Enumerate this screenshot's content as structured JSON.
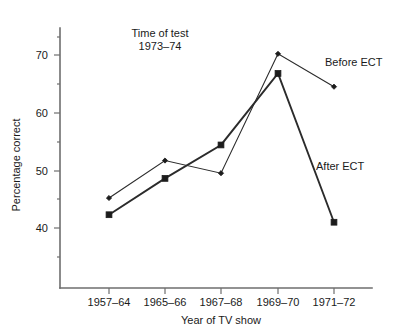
{
  "chart_data": {
    "type": "line",
    "title": "",
    "subtitle": "",
    "xlabel": "Year of TV show",
    "ylabel": "Percentage correct",
    "categories": [
      "1957–64",
      "1965–66",
      "1967–68",
      "1969–70",
      "1971–72"
    ],
    "series": [
      {
        "name": "Before ECT",
        "marker": "diamond",
        "values": [
          45.2,
          51.7,
          49.5,
          70.2,
          64.5
        ]
      },
      {
        "name": "After ECT",
        "marker": "square",
        "values": [
          42.3,
          48.6,
          54.4,
          66.8,
          41.0
        ]
      }
    ],
    "ylim": [
      30,
      73
    ],
    "yticks": [
      40,
      50,
      60,
      70
    ],
    "ytick_labels": [
      "40",
      "50",
      "60",
      "70"
    ],
    "y_minor_ticks": [
      35,
      45,
      55,
      65
    ],
    "grid": false,
    "legend_position": "inline-right",
    "annotations": [
      {
        "id": "time-of-test",
        "line1": "Time of test",
        "line2": "1973–74"
      },
      {
        "id": "before-ect-label",
        "text": "Before ECT"
      },
      {
        "id": "after-ect-label",
        "text": "After ECT"
      }
    ]
  },
  "axes": {
    "y_title": "Percentage correct",
    "x_title": "Year of TV show"
  },
  "colors": {
    "axis": "#6e6e6e",
    "line": "#2b2b2b",
    "marker": "#1c1c1c",
    "text": "#1a1a1a",
    "background": "#ffffff"
  }
}
